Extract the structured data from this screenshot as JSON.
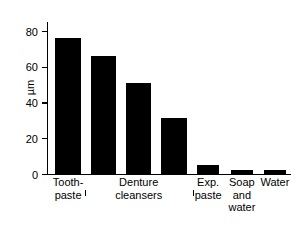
{
  "chart_data": {
    "type": "bar",
    "title": "",
    "xlabel": "",
    "ylabel": "µm",
    "ylim": [
      0,
      85
    ],
    "yticks": [
      0,
      20,
      40,
      60,
      80
    ],
    "ytick_labels": [
      "0",
      "20",
      "40",
      "60",
      "80"
    ],
    "grid": false,
    "legend": null,
    "categories": [
      "Tooth-\npaste",
      "Denture\ncleanser A",
      "Denture\ncleanser B",
      "Denture\ncleanser C",
      "Exp.\npaste",
      "Soap\nand\nwater",
      "Water"
    ],
    "values": [
      76,
      66,
      51,
      31.5,
      5,
      2,
      2
    ],
    "annotations": [
      {
        "type": "group-bracket",
        "label": "Denture\ncleansers",
        "spans_bars": [
          1,
          2,
          3
        ]
      }
    ]
  },
  "axis": {
    "y_label": "µm",
    "ticks": [
      {
        "value": 80,
        "label": "80"
      },
      {
        "value": 60,
        "label": "60"
      },
      {
        "value": 40,
        "label": "40"
      },
      {
        "value": 20,
        "label": "20"
      },
      {
        "value": 0,
        "label": "0"
      }
    ]
  },
  "category_labels": [
    {
      "line1": "Tooth-",
      "line2": "paste"
    },
    {
      "line1": "Denture",
      "line2": "cleansers"
    },
    {
      "line1": "Exp.",
      "line2": "paste"
    },
    {
      "line1": "Soap",
      "line2": "and",
      "line3": "water"
    },
    {
      "line1": "Water",
      "line2": "",
      "line3": ""
    }
  ],
  "colors": {
    "bar": "#000000",
    "axis": "#000000",
    "background": "#ffffff",
    "text": "#000000"
  }
}
